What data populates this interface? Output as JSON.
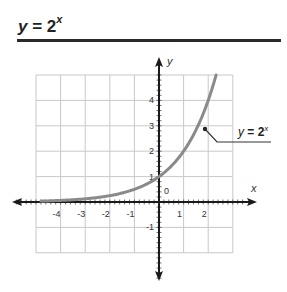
{
  "header": {
    "title_var": "y",
    "title_eq": " = 2",
    "title_exp": "x"
  },
  "chart_data": {
    "type": "line",
    "xlabel": "x",
    "ylabel": "y",
    "xlim": [
      -5,
      3
    ],
    "ylim": [
      -2,
      5
    ],
    "grid": true,
    "x_ticks": [
      -4,
      -3,
      -2,
      -1,
      1,
      2
    ],
    "x_tick_labels": [
      "-4",
      "-3",
      "-2",
      "-1",
      "1",
      "2"
    ],
    "y_ticks": [
      -1,
      1,
      2,
      3,
      4
    ],
    "y_tick_labels": [
      "-1",
      "1",
      "2",
      "3",
      "4"
    ],
    "origin_label": "0",
    "series": [
      {
        "name": "y = 2^x",
        "x": [
          -4.8,
          -4,
          -3,
          -2,
          -1,
          0,
          0.5,
          1,
          1.5,
          2,
          2.32
        ],
        "y": [
          0.036,
          0.0625,
          0.125,
          0.25,
          0.5,
          1,
          1.414,
          2,
          2.828,
          4,
          5
        ]
      }
    ],
    "annotation": {
      "text_var": "y",
      "text_eq": " = 2",
      "text_exp": "x",
      "point": [
        1.85,
        2.9
      ]
    }
  }
}
